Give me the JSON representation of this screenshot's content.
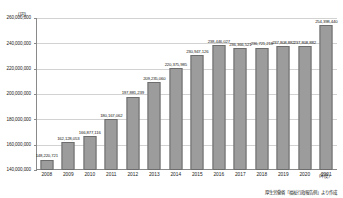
{
  "chart_data": {
    "type": "bar",
    "title": "",
    "subtitle": "",
    "xlabel": "(年度)",
    "ylabel": "(円)",
    "yunit": "(円)",
    "ylim": [
      140000000,
      260000000
    ],
    "ytick_step": 20000000,
    "grid": true,
    "legend": null,
    "categories": [
      "2008",
      "2009",
      "2010",
      "2011",
      "2012",
      "2013",
      "2014",
      "2015",
      "2016",
      "2017",
      "2018",
      "2019",
      "2020",
      "2021"
    ],
    "ytick_labels": [
      "140,000,000",
      "160,000,000",
      "180,000,000",
      "200,000,000",
      "220,000,000",
      "240,000,000",
      "260,000,000"
    ],
    "ytick_values": [
      140000000,
      160000000,
      180000000,
      200000000,
      220000000,
      240000000,
      260000000
    ],
    "values": [
      148220721,
      162128053,
      166877116,
      180167062,
      197881239,
      209235060,
      220375985,
      230947126,
      238446027,
      236366521,
      236721218,
      237808882,
      254398440,
      254398440
    ],
    "series": [
      {
        "name": "金額",
        "values": [
          148220721,
          162128053,
          166877116,
          180167062,
          197881239,
          209235060,
          220375985,
          230947126,
          238446027,
          236366521,
          236721218,
          237808882,
          237808882,
          254398440
        ]
      }
    ],
    "data_labels": [
      "148,220,721",
      "162,128,053",
      "166,877,116",
      "180,167,062",
      "197,881,239",
      "209,235,060",
      "220,375,985",
      "230,947,126",
      "238,446,027",
      "236,366,521",
      "236,721,218",
      "237,808,882",
      "254,398,440",
      "254,398,440"
    ],
    "points": [
      {
        "category": "2008",
        "value": 148220721,
        "label": "148,220,721"
      },
      {
        "category": "2009",
        "value": 162128053,
        "label": "162,128,053"
      },
      {
        "category": "2010",
        "value": 166877116,
        "label": "166,877,116"
      },
      {
        "category": "2011",
        "value": 180167062,
        "label": "180,167,062"
      },
      {
        "category": "2012",
        "value": 197881239,
        "label": "197,881,239"
      },
      {
        "category": "2013",
        "value": 209235060,
        "label": "209,235,060"
      },
      {
        "category": "2014",
        "value": 220375985,
        "label": "220,375,985"
      },
      {
        "category": "2015",
        "value": 230947126,
        "label": "230,947,126"
      },
      {
        "category": "2016",
        "value": 238446027,
        "label": "238,446,027"
      },
      {
        "category": "2017",
        "value": 236366521,
        "label": "236,366,521"
      },
      {
        "category": "2018",
        "value": 236721218,
        "label": "236,721,218"
      },
      {
        "category": "2019",
        "value": 237808882,
        "label": "237,808,882"
      },
      {
        "category": "2020",
        "value": 237808882,
        "label": "237,808,882"
      },
      {
        "category": "2021",
        "value": 254398440,
        "label": "254,398,440"
      }
    ],
    "source_note": "厚生労働省「福祉行政報告例」より作成",
    "colors": {
      "bar_fill": "#9c9c9c",
      "bar_border": "#6d6d6d",
      "gridline": "#d2d2d2",
      "axis": "#8a8a8a",
      "text": "#1a1a1a",
      "background": "#ffffff"
    }
  }
}
